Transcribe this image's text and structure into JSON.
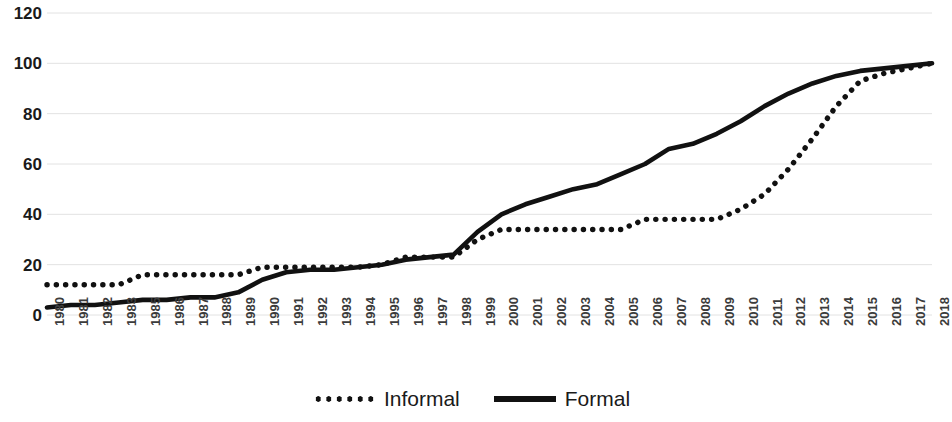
{
  "chart_data": {
    "type": "line",
    "title": "",
    "subtitle": "",
    "xlabel": "",
    "ylabel": "",
    "ylim": [
      0,
      120
    ],
    "yticks": [
      0,
      20,
      40,
      60,
      80,
      100,
      120
    ],
    "grid": "horizontal",
    "legend_position": "bottom-center",
    "categories": [
      "1980",
      "1981",
      "1982",
      "1983",
      "1985",
      "1986",
      "1987",
      "1988",
      "1989",
      "1990",
      "1991",
      "1992",
      "1993",
      "1994",
      "1995",
      "1996",
      "1997",
      "1998",
      "1999",
      "2000",
      "2001",
      "2002",
      "2003",
      "2004",
      "2005",
      "2006",
      "2007",
      "2008",
      "2009",
      "2010",
      "2011",
      "2012",
      "2013",
      "2014",
      "2015",
      "2016",
      "2017",
      "2018"
    ],
    "series": [
      {
        "name": "Informal",
        "style": "dotted",
        "color": "#111111",
        "values": [
          12,
          12,
          12,
          12,
          16,
          16,
          16,
          16,
          16,
          19,
          19,
          19,
          19,
          19,
          20,
          23,
          23,
          23,
          30,
          34,
          34,
          34,
          34,
          34,
          34,
          38,
          38,
          38,
          38,
          42,
          48,
          58,
          70,
          83,
          93,
          96,
          98,
          100
        ]
      },
      {
        "name": "Formal",
        "style": "solid",
        "color": "#111111",
        "values": [
          3,
          4,
          4,
          5,
          6,
          6,
          7,
          7,
          9,
          14,
          17,
          18,
          18,
          19,
          20,
          22,
          23,
          24,
          33,
          40,
          44,
          47,
          50,
          52,
          56,
          60,
          66,
          68,
          72,
          77,
          83,
          88,
          92,
          95,
          97,
          98,
          99,
          100
        ]
      }
    ]
  },
  "legend": {
    "items": [
      {
        "label": "Informal",
        "marker": "dotted-line-marker"
      },
      {
        "label": "Formal",
        "marker": "solid-line-marker"
      }
    ]
  }
}
